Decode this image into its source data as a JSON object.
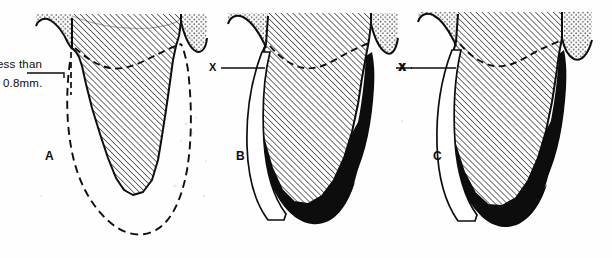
{
  "figure": {
    "kind": "dental-periodontal-diagram",
    "caption_absent": true,
    "width": 612,
    "height": 258,
    "background_color": "#fefefe",
    "ink_color": "#0d0d0d",
    "fill_black": "#0d0d0d",
    "hatch_color": "#1a1a1a",
    "stipple_color": "#3a3a3a",
    "panel_count": 3
  },
  "annotations": {
    "less_than_line1": "ess than",
    "less_than_line2": "0.8mm.",
    "panel_a_letter": "A",
    "panel_b_letter": "B",
    "panel_c_letter": "C",
    "x_marker_b_left": "X",
    "x_marker_b_right": "X",
    "x_marker_c_left": "X"
  },
  "panels": [
    {
      "id": "A",
      "letter": "A",
      "center_x": 125,
      "callout": "ess than 0.8mm.",
      "features": [
        "hatched-root",
        "stippled-gingiva-left",
        "stippled-gingiva-right",
        "dashed-bone-crest-line",
        "dashed-outer-socket-outline",
        "dashed-interdental-marker"
      ]
    },
    {
      "id": "B",
      "letter": "B",
      "center_x": 320,
      "callout": "X",
      "features": [
        "hatched-root",
        "stippled-gingiva-left",
        "stippled-gingiva-right",
        "dashed-bone-crest-line",
        "black-filled-resorption",
        "white-outlined-recession-band",
        "x-leader-line-left",
        "x-leader-line-right"
      ]
    },
    {
      "id": "C",
      "letter": "C",
      "center_x": 510,
      "callout": "X",
      "features": [
        "hatched-root",
        "stippled-gingiva-left",
        "stippled-gingiva-right",
        "dashed-bone-crest-line",
        "black-filled-resorption",
        "white-outlined-recession-band",
        "x-leader-line-left"
      ]
    }
  ]
}
